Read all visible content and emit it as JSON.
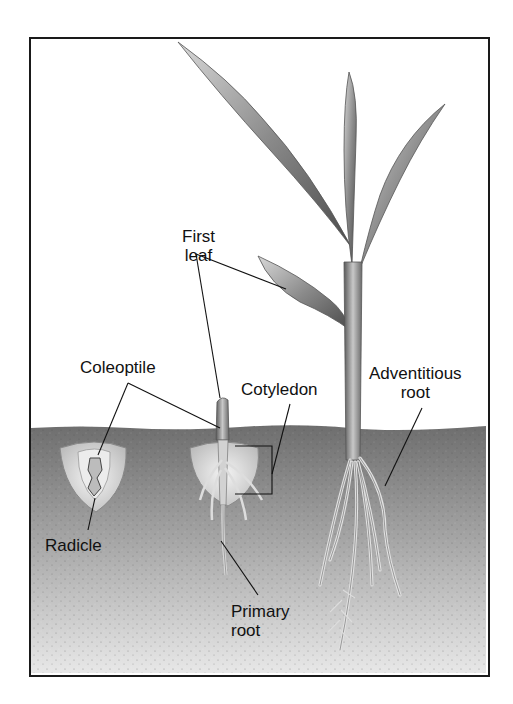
{
  "diagram": {
    "type": "labeled-illustration",
    "labels": {
      "first_leaf_line1": "First",
      "first_leaf_line2": "leaf",
      "coleoptile": "Coleoptile",
      "cotyledon": "Cotyledon",
      "adventitious_line1": "Adventitious",
      "adventitious_line2": "root",
      "radicle": "Radicle",
      "primary_line1": "Primary",
      "primary_line2": "root"
    },
    "stages": [
      "germinating seed",
      "young seedling",
      "mature seedling"
    ],
    "colors": {
      "frame": "#1a1a1a",
      "sky": "#ffffff",
      "soil_top": "#6e6e6e",
      "soil_bottom": "#e6e6e6",
      "leaf_dark": "#555555",
      "leaf_light": "#cfcfcf",
      "leader_line": "#111111"
    }
  }
}
